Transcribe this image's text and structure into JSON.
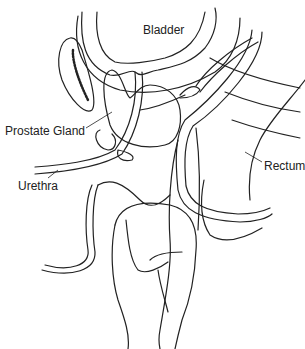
{
  "diagram": {
    "type": "anatomical illustration",
    "labels": {
      "bladder": "Bladder",
      "prostate": "Prostate Gland",
      "urethra": "Urethra",
      "rectum": "Rectum"
    },
    "colors": {
      "line": "#222222",
      "background": "#ffffff"
    }
  }
}
